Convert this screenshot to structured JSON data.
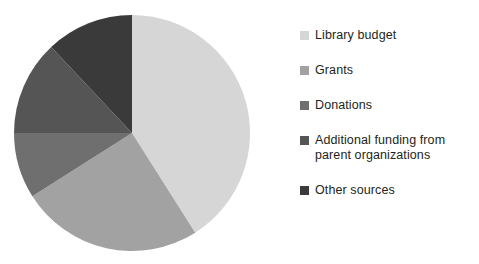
{
  "chart_data": {
    "type": "pie",
    "title": "",
    "subtitle": "",
    "legend_position": "right",
    "start_angle_deg": 0,
    "direction": "clockwise",
    "categories": [
      "Library budget",
      "Grants",
      "Donations",
      "Additional funding from\nparent organizations",
      "Other sources"
    ],
    "values": [
      41,
      25,
      9,
      13,
      12
    ],
    "value_unit": "percent",
    "colors": [
      "#d6d6d6",
      "#a2a2a2",
      "#6f6f6f",
      "#555555",
      "#3a3a3a"
    ],
    "slices": [
      {
        "label": "Library budget",
        "value": 41,
        "color": "#d6d6d6",
        "start_deg": 0,
        "end_deg": 147.6
      },
      {
        "label": "Grants",
        "value": 25,
        "color": "#a2a2a2",
        "start_deg": 147.6,
        "end_deg": 237.6
      },
      {
        "label": "Donations",
        "value": 9,
        "color": "#6f6f6f",
        "start_deg": 237.6,
        "end_deg": 270.0
      },
      {
        "label": "Additional funding from parent organizations",
        "value": 13,
        "color": "#555555",
        "start_deg": 270.0,
        "end_deg": 316.8
      },
      {
        "label": "Other sources",
        "value": 12,
        "color": "#3a3a3a",
        "start_deg": 316.8,
        "end_deg": 360.0
      }
    ],
    "grid": false,
    "xlabel": "",
    "ylabel": ""
  },
  "legend": {
    "items": [
      {
        "label": "Library budget",
        "color": "#d6d6d6"
      },
      {
        "label": "Grants",
        "color": "#a2a2a2"
      },
      {
        "label": "Donations",
        "color": "#6f6f6f"
      },
      {
        "label": "Additional funding from\nparent organizations",
        "color": "#555555"
      },
      {
        "label": "Other sources",
        "color": "#3a3a3a"
      }
    ]
  },
  "geometry": {
    "center_x": 132,
    "center_y": 133,
    "radius": 118
  }
}
